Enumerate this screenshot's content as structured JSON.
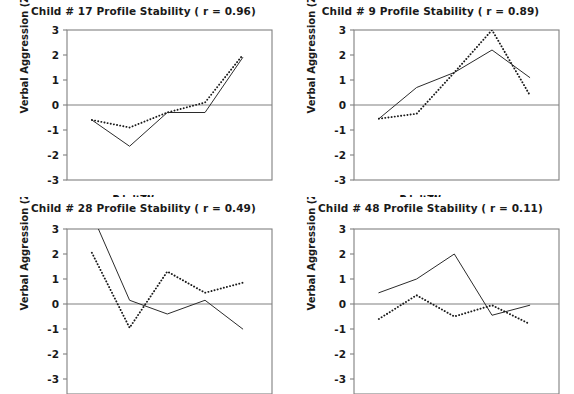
{
  "figure": {
    "name": "profile-stability-multipanel",
    "background": "#ffffff",
    "axis_color": "#808080",
    "solid_series_color": "#2b2b2b",
    "dotted_series_color": "#1a1a1a"
  },
  "axes": {
    "ylabel": "Verbal Aggression (Z)",
    "yticks": [
      "3",
      "2",
      "1",
      "0",
      "-1",
      "-2",
      "-3"
    ],
    "ylim": [
      -3,
      3
    ],
    "xcategories": [
      "Peer Approach",
      "Peer Tease",
      "Adult Praise",
      "Adult Warn",
      "Adult Punish"
    ],
    "xlabels_row_top": [
      "Peer Tease",
      "Adult Warn"
    ],
    "xlabels_row_bottom": [
      "Peer Approach",
      "Adult Praise",
      "Adult Punish"
    ]
  },
  "panels": [
    {
      "id": "child-17",
      "title": "Child # 17  Profile Stability ( r = 0.96)",
      "child": "17",
      "r": "0.96",
      "show_xlabels": true,
      "show_yticks_all": true,
      "clipped_bottom": false
    },
    {
      "id": "child-9",
      "title": "Child # 9  Profile Stability ( r = 0.89)",
      "child": "9",
      "r": "0.89",
      "show_xlabels": true,
      "show_yticks_all": true,
      "clipped_bottom": false
    },
    {
      "id": "child-28",
      "title": "Child # 28  Profile Stability ( r = 0.49)",
      "child": "28",
      "r": "0.49",
      "show_xlabels": false,
      "show_yticks_all": false,
      "clipped_bottom": true
    },
    {
      "id": "child-48",
      "title": "Child # 48  Profile Stability ( r = 0.11)",
      "child": "48",
      "r": "0.11",
      "show_xlabels": false,
      "show_yticks_all": false,
      "clipped_bottom": true
    }
  ],
  "chart_data": [
    {
      "type": "line",
      "title": "Child # 17  Profile Stability ( r = 0.96)",
      "xlabel": "",
      "ylabel": "Verbal Aggression (Z)",
      "categories": [
        "Peer Approach",
        "Peer Tease",
        "Adult Praise",
        "Adult Warn",
        "Adult Punish"
      ],
      "ylim": [
        -3,
        3
      ],
      "grid": false,
      "legend": "none",
      "series": [
        {
          "name": "Time 1 (solid)",
          "style": "solid",
          "values": [
            -0.6,
            -1.65,
            -0.3,
            -0.3,
            1.9
          ]
        },
        {
          "name": "Time 2 (dotted)",
          "style": "dotted",
          "values": [
            -0.6,
            -0.9,
            -0.3,
            0.1,
            2.0
          ]
        }
      ]
    },
    {
      "type": "line",
      "title": "Child # 9  Profile Stability ( r = 0.89)",
      "xlabel": "",
      "ylabel": "Verbal Aggression (Z)",
      "categories": [
        "Peer Approach",
        "Peer Tease",
        "Adult Praise",
        "Adult Warn",
        "Adult Punish"
      ],
      "ylim": [
        -3,
        3
      ],
      "grid": false,
      "legend": "none",
      "series": [
        {
          "name": "Time 1 (solid)",
          "style": "solid",
          "values": [
            -0.55,
            0.7,
            1.3,
            2.2,
            1.1
          ]
        },
        {
          "name": "Time 2 (dotted)",
          "style": "dotted",
          "values": [
            -0.55,
            -0.35,
            1.3,
            3.0,
            0.4
          ]
        }
      ]
    },
    {
      "type": "line",
      "title": "Child # 28  Profile Stability ( r = 0.49)",
      "xlabel": "",
      "ylabel": "Verbal Aggression (Z)",
      "categories": [
        "Peer Approach",
        "Peer Tease",
        "Adult Praise",
        "Adult Warn",
        "Adult Punish"
      ],
      "ylim": [
        -3,
        3
      ],
      "grid": false,
      "legend": "none",
      "series": [
        {
          "name": "Time 1 (solid)",
          "style": "solid",
          "values": [
            3.6,
            0.15,
            -0.4,
            0.15,
            -1.0
          ]
        },
        {
          "name": "Time 2 (dotted)",
          "style": "dotted",
          "values": [
            2.05,
            -0.95,
            1.3,
            0.45,
            0.85
          ]
        }
      ]
    },
    {
      "type": "line",
      "title": "Child # 48  Profile Stability ( r = 0.11)",
      "xlabel": "",
      "ylabel": "Verbal Aggression (Z)",
      "categories": [
        "Peer Approach",
        "Peer Tease",
        "Adult Praise",
        "Adult Warn",
        "Adult Punish"
      ],
      "ylim": [
        -3,
        3
      ],
      "grid": false,
      "legend": "none",
      "series": [
        {
          "name": "Time 1 (solid)",
          "style": "solid",
          "values": [
            0.45,
            1.0,
            2.0,
            -0.45,
            -0.05
          ]
        },
        {
          "name": "Time 2 (dotted)",
          "style": "dotted",
          "values": [
            -0.6,
            0.35,
            -0.5,
            -0.05,
            -0.8
          ]
        }
      ]
    }
  ]
}
